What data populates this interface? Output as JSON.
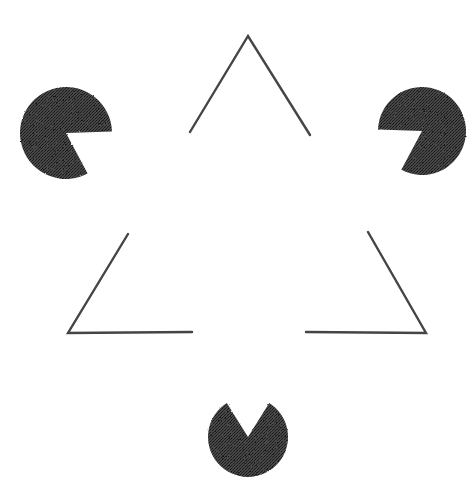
{
  "figure": {
    "description": "Illusory contour figure: three black pac-man discs and three black angle outlines arranged so that a bright white triangle appears without any drawn edges.",
    "canvas": {
      "width": 467,
      "height": 480
    },
    "colors": {
      "background": "#ffffff",
      "ink": "#3b3b3b",
      "ink_dark": "#2e2e2e",
      "stroke": "#444444"
    },
    "texture": {
      "name": "halftone-dither",
      "dot_color": "#1d1d1d",
      "base_color": "#454545",
      "cell": 3
    },
    "illusory_triangle": {
      "name": "illusory-white-triangle",
      "orientation": "point-up",
      "vertices": [
        {
          "label": "top",
          "x": 248,
          "y": 133
        },
        {
          "label": "bottom-left",
          "x": 68,
          "y": 418
        },
        {
          "label": "bottom-right",
          "x": 412,
          "y": 418
        }
      ]
    },
    "pacmen": [
      {
        "name": "pacman-top-left",
        "cx": 66,
        "cy": 133,
        "r": 46,
        "wedge_start_deg": -2,
        "wedge_end_deg": 62,
        "notch_direction": "right"
      },
      {
        "name": "pacman-top-right",
        "cx": 422,
        "cy": 131,
        "r": 44,
        "wedge_start_deg": 118,
        "wedge_end_deg": 182,
        "notch_direction": "left"
      },
      {
        "name": "pacman-bottom",
        "cx": 248,
        "cy": 437,
        "r": 40,
        "wedge_start_deg": 238,
        "wedge_end_deg": 302,
        "notch_direction": "up"
      }
    ],
    "outline_segments": [
      {
        "name": "outline-corner-top",
        "corner_label": "top-apex",
        "points": [
          [
            190,
            132
          ],
          [
            248,
            36
          ],
          [
            310,
            135
          ]
        ]
      },
      {
        "name": "outline-corner-bottom-left",
        "corner_label": "bottom-left",
        "points": [
          [
            128,
            234
          ],
          [
            68,
            333
          ],
          [
            192,
            332
          ]
        ]
      },
      {
        "name": "outline-corner-bottom-right",
        "corner_label": "bottom-right",
        "points": [
          [
            368,
            232
          ],
          [
            426,
            333
          ],
          [
            306,
            332
          ]
        ]
      }
    ],
    "outline_triangle": {
      "name": "outline-triangle-inverted",
      "orientation": "point-up",
      "vertices": [
        {
          "label": "apex",
          "x": 248,
          "y": 36
        },
        {
          "label": "bottom-left",
          "x": 68,
          "y": 333
        },
        {
          "label": "bottom-right",
          "x": 426,
          "y": 333
        }
      ],
      "stroke_width": 2.4
    }
  }
}
